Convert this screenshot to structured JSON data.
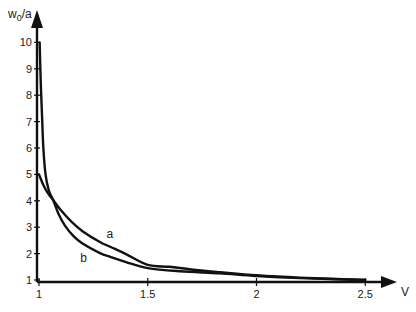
{
  "chart_data": {
    "type": "line",
    "title": "",
    "xlabel": "V",
    "ylabel": "w0/a",
    "ylabel_main": "w",
    "ylabel_sub": "0",
    "ylabel_rest": "/a",
    "xlim": [
      1,
      2.55
    ],
    "ylim": [
      1,
      10.5
    ],
    "grid": false,
    "legend": "inline labels",
    "x_ticks": [
      1,
      1.5,
      2,
      2.5
    ],
    "x_tick_labels": [
      "1",
      "1.5",
      "2",
      "2.5"
    ],
    "y_ticks": [
      1,
      2,
      3,
      4,
      5,
      6,
      7,
      8,
      9,
      10
    ],
    "y_tick_labels": [
      "1",
      "2",
      "3",
      "4",
      "5",
      "6",
      "7",
      "8",
      "9",
      "10"
    ],
    "series": [
      {
        "name": "a",
        "label_at": [
          1.31,
          2.6
        ],
        "x": [
          1.0,
          1.02,
          1.04,
          1.065,
          1.1,
          1.15,
          1.2,
          1.28,
          1.33,
          1.4,
          1.5,
          1.6,
          1.7,
          1.83,
          2.0,
          2.2,
          2.5
        ],
        "y": [
          5.0,
          4.6,
          4.3,
          4.03,
          3.65,
          3.2,
          2.85,
          2.44,
          2.25,
          1.98,
          1.57,
          1.5,
          1.4,
          1.3,
          1.18,
          1.09,
          1.0
        ]
      },
      {
        "name": "b",
        "label_at": [
          1.19,
          1.7
        ],
        "x": [
          1.003,
          1.008,
          1.015,
          1.02,
          1.03,
          1.045,
          1.065,
          1.09,
          1.12,
          1.16,
          1.2,
          1.28,
          1.33,
          1.4,
          1.5,
          1.65,
          1.83,
          2.0,
          2.2,
          2.5
        ],
        "y": [
          10.0,
          8.5,
          7.0,
          6.0,
          5.0,
          4.4,
          4.03,
          3.5,
          3.05,
          2.65,
          2.38,
          2.02,
          1.87,
          1.68,
          1.45,
          1.33,
          1.25,
          1.15,
          1.07,
          1.0
        ]
      }
    ]
  }
}
